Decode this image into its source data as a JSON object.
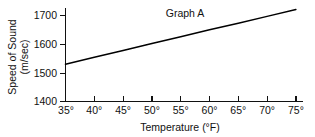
{
  "chart_data": {
    "type": "line",
    "title": "Graph A",
    "xlabel": "Temperature (°F)",
    "ylabel_line1": "Speed of Sound",
    "ylabel_line2": "(m/sec)",
    "ylabel": "Speed of Sound (m/sec)",
    "x": [
      35,
      40,
      45,
      50,
      55,
      60,
      65,
      70,
      75
    ],
    "xticklabels": [
      "35°",
      "40°",
      "45°",
      "50°",
      "55°",
      "60°",
      "65°",
      "70°",
      "75°"
    ],
    "yticks": [
      1400,
      1500,
      1600,
      1700
    ],
    "yticklabels": [
      "1400",
      "1500",
      "1600",
      "1700"
    ],
    "xlim": [
      35,
      75
    ],
    "ylim": [
      1400,
      1735
    ],
    "grid": false,
    "legend": false,
    "series": [
      {
        "name": "Speed of Sound",
        "color": "#000000",
        "values": [
          1530,
          1554,
          1578,
          1602,
          1626,
          1650,
          1673,
          1697,
          1721
        ]
      }
    ]
  },
  "figure": {
    "background_color": "#ffffff",
    "axis_color": "#111111"
  }
}
